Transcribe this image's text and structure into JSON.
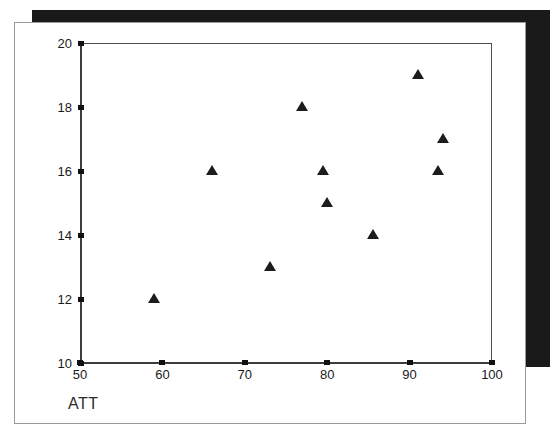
{
  "chart_data": {
    "type": "scatter",
    "title": "",
    "xlabel": "ATT",
    "ylabel": "",
    "xlim": [
      50,
      100
    ],
    "ylim": [
      10,
      20
    ],
    "grid": false,
    "legend": null,
    "marker": "triangle",
    "marker_color": "#1c1c1c",
    "xticks": [
      50,
      60,
      70,
      80,
      90,
      100
    ],
    "yticks": [
      10,
      12,
      14,
      16,
      18,
      20
    ],
    "xtick_labels": [
      "50",
      "60",
      "70",
      "80",
      "90",
      "100"
    ],
    "ytick_labels": [
      "10",
      "12",
      "14",
      "16",
      "18",
      "20"
    ],
    "points": [
      {
        "x": 59,
        "y": 12
      },
      {
        "x": 66,
        "y": 16
      },
      {
        "x": 73,
        "y": 13
      },
      {
        "x": 77,
        "y": 18
      },
      {
        "x": 79.5,
        "y": 16
      },
      {
        "x": 80,
        "y": 15
      },
      {
        "x": 85.5,
        "y": 14
      },
      {
        "x": 91,
        "y": 19
      },
      {
        "x": 93.5,
        "y": 16
      },
      {
        "x": 94,
        "y": 17
      }
    ]
  },
  "figure": {
    "axis_title": "ATT",
    "frame_color": "#4d4d4d",
    "page_border_color": "#9a9a9a",
    "shadow_color": "#1a1a1a",
    "background": "#ffffff"
  }
}
